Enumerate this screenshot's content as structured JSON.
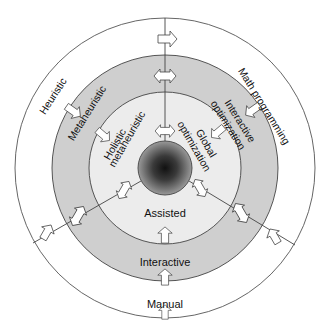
{
  "diagram": {
    "title": "",
    "center": {
      "x": 165,
      "y": 168
    },
    "rings": [
      {
        "name": "manual-ring",
        "radius": 150,
        "fill": "#ffffff",
        "stroke": "#555555"
      },
      {
        "name": "interactive-ring",
        "radius": 113,
        "fill": "#cfcfcf",
        "stroke": "#444444"
      },
      {
        "name": "assisted-ring",
        "radius": 76,
        "fill": "#ececec",
        "stroke": "#444444"
      },
      {
        "name": "core",
        "radius": 27,
        "fill_outer": "#8a8a8a",
        "fill_inner": "#111111",
        "stroke": "#444444"
      }
    ],
    "labels": {
      "manual": "Manual",
      "interactive": "Interactive",
      "assisted": "Assisted",
      "heuristic": "Heuristic",
      "metaheuristic": "Metaheuristic",
      "holistic_line1": "Holistic",
      "holistic_line2": "metaheuristic",
      "math_programming": "Math programming",
      "interactive_opt_line1": "Interactive",
      "interactive_opt_line2": "optimization",
      "global_opt_line1": "Global",
      "global_opt_line2": "optimization"
    },
    "colors": {
      "ring_gray": "#cfcfcf",
      "ring_light": "#ececec",
      "line": "#444444",
      "arrow_fill": "#ffffff",
      "text": "#111111"
    }
  }
}
